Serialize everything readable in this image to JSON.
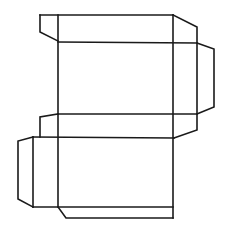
{
  "diagram": {
    "type": "box-net",
    "stroke_color": "#1a1a1a",
    "background": "#ffffff",
    "segments": [
      {
        "name": "top-edge",
        "points": "40,15 173,15"
      },
      {
        "name": "top-left-flap",
        "points": "40,15 40,32 58,41"
      },
      {
        "name": "top-right-slant",
        "points": "173,15 197,27 197,130 174,138"
      },
      {
        "name": "main-left-vertical",
        "points": "58,15 58,207"
      },
      {
        "name": "main-right-vertical",
        "points": "173,15 173,218"
      },
      {
        "name": "fold-line-1",
        "points": "58,42 197,43"
      },
      {
        "name": "right-flap",
        "points": "197,43 214,49 214,107 197,114"
      },
      {
        "name": "fold-line-2",
        "points": "58,114 197,114"
      },
      {
        "name": "second-left-flap",
        "points": "58,114 40,117 40,137"
      },
      {
        "name": "fold-line-3",
        "points": "33,137 174,138"
      },
      {
        "name": "left-side-flap",
        "points": "33,137 18,141 18,199 33,207"
      },
      {
        "name": "left-panel-vertical",
        "points": "33,137 33,207"
      },
      {
        "name": "fold-line-4",
        "points": "33,207 173,207"
      },
      {
        "name": "bottom-flap",
        "points": "58,207 66,218 173,218"
      }
    ]
  }
}
